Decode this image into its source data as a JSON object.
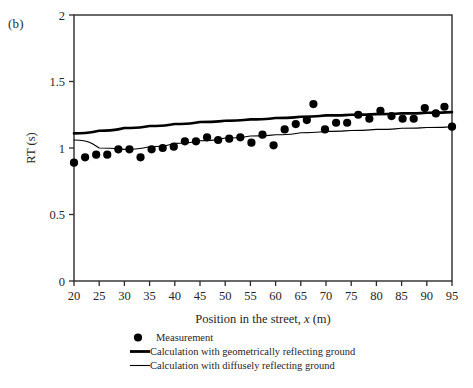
{
  "panel": {
    "label": "(b)"
  },
  "chart_data": {
    "type": "scatter",
    "title": "",
    "xlabel_prefix": "Position in the street, ",
    "xlabel_italic": "x",
    "xlabel_suffix": " (m)",
    "xlabel": "Position in the street, x (m)",
    "ylabel": "RT (s)",
    "xlim": [
      20,
      95
    ],
    "ylim": [
      0,
      2
    ],
    "xticks": [
      20,
      25,
      30,
      35,
      40,
      45,
      50,
      55,
      60,
      65,
      70,
      75,
      80,
      85,
      90,
      95
    ],
    "xtick_labels": [
      "20",
      "25",
      "30",
      "35",
      "40",
      "45",
      "50",
      "55",
      "60",
      "65",
      "70",
      "75",
      "80",
      "85",
      "90",
      "95"
    ],
    "yticks": [
      0,
      0.5,
      1,
      1.5,
      2
    ],
    "ytick_labels": [
      "0",
      "0.5",
      "1",
      "1.5",
      "2"
    ],
    "grid": false,
    "legend_position": "below-left",
    "series": [
      {
        "name": "Measurement",
        "type": "scatter",
        "marker": "circle",
        "color": "#000000",
        "points": [
          [
            20.0,
            0.89
          ],
          [
            22.2,
            0.93
          ],
          [
            24.4,
            0.95
          ],
          [
            26.6,
            0.95
          ],
          [
            28.8,
            0.99
          ],
          [
            31.0,
            0.99
          ],
          [
            33.2,
            0.93
          ],
          [
            35.4,
            0.99
          ],
          [
            37.6,
            1.0
          ],
          [
            39.8,
            1.01
          ],
          [
            42.0,
            1.05
          ],
          [
            44.2,
            1.05
          ],
          [
            46.4,
            1.08
          ],
          [
            48.6,
            1.06
          ],
          [
            50.8,
            1.07
          ],
          [
            53.0,
            1.08
          ],
          [
            55.2,
            1.04
          ],
          [
            57.4,
            1.1
          ],
          [
            59.6,
            1.02
          ],
          [
            61.8,
            1.14
          ],
          [
            64.0,
            1.18
          ],
          [
            66.2,
            1.21
          ],
          [
            67.5,
            1.33
          ],
          [
            69.8,
            1.14
          ],
          [
            72.0,
            1.19
          ],
          [
            74.2,
            1.19
          ],
          [
            76.4,
            1.25
          ],
          [
            78.6,
            1.22
          ],
          [
            80.8,
            1.28
          ],
          [
            83.0,
            1.24
          ],
          [
            85.2,
            1.22
          ],
          [
            87.4,
            1.22
          ],
          [
            89.6,
            1.3
          ],
          [
            91.8,
            1.26
          ],
          [
            93.5,
            1.31
          ],
          [
            95.0,
            1.16
          ]
        ]
      },
      {
        "name": "Calculation with geometrically reflecting ground",
        "type": "line",
        "linewidth": "thick",
        "color": "#000000",
        "points": [
          [
            20.0,
            1.11
          ],
          [
            25.0,
            1.13
          ],
          [
            30.0,
            1.15
          ],
          [
            35.0,
            1.165
          ],
          [
            40.0,
            1.18
          ],
          [
            45.0,
            1.195
          ],
          [
            50.0,
            1.205
          ],
          [
            55.0,
            1.215
          ],
          [
            60.0,
            1.225
          ],
          [
            65.0,
            1.235
          ],
          [
            70.0,
            1.245
          ],
          [
            75.0,
            1.25
          ],
          [
            80.0,
            1.255
          ],
          [
            85.0,
            1.26
          ],
          [
            90.0,
            1.265
          ],
          [
            95.0,
            1.27
          ]
        ]
      },
      {
        "name": "Calculation with diffusely reflecting ground",
        "type": "line",
        "linewidth": "thin",
        "color": "#000000",
        "points": [
          [
            20.0,
            1.06
          ],
          [
            25.0,
            1.0
          ],
          [
            30.0,
            0.99
          ],
          [
            35.0,
            1.01
          ],
          [
            40.0,
            1.035
          ],
          [
            45.0,
            1.055
          ],
          [
            50.0,
            1.075
          ],
          [
            55.0,
            1.09
          ],
          [
            60.0,
            1.1
          ],
          [
            65.0,
            1.115
          ],
          [
            70.0,
            1.125
          ],
          [
            75.0,
            1.132
          ],
          [
            80.0,
            1.14
          ],
          [
            85.0,
            1.148
          ],
          [
            90.0,
            1.154
          ],
          [
            95.0,
            1.16
          ]
        ]
      }
    ]
  },
  "legend": {
    "items": [
      {
        "marker": "dot",
        "label": "Measurement"
      },
      {
        "marker": "thick-line",
        "label": "Calculation with geometrically reflecting ground"
      },
      {
        "marker": "thin-line",
        "label": "Calculation with diffusely reflecting ground"
      }
    ]
  }
}
